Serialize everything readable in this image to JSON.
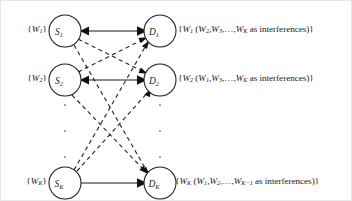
{
  "figure": {
    "background_color": "#ffffff",
    "line_color": "#1a1a1a",
    "width": 352,
    "height": 201
  },
  "nodes": {
    "sources": [
      {
        "id": "S1",
        "label": "S",
        "subscript": "1",
        "cx": 64,
        "cy": 30,
        "r": 16
      },
      {
        "id": "S2",
        "label": "S",
        "subscript": "2",
        "cx": 64,
        "cy": 79,
        "r": 16
      },
      {
        "id": "SK",
        "label": "S",
        "subscript": "K",
        "cx": 64,
        "cy": 182,
        "r": 16
      }
    ],
    "destinations": [
      {
        "id": "D1",
        "label": "D",
        "subscript": "1",
        "cx": 159,
        "cy": 30,
        "r": 16
      },
      {
        "id": "D2",
        "label": "D",
        "subscript": "2",
        "cx": 159,
        "cy": 79,
        "r": 16
      },
      {
        "id": "DK",
        "label": "D",
        "subscript": "K",
        "cx": 159,
        "cy": 182,
        "r": 16
      }
    ]
  },
  "left_labels": [
    {
      "id": "w1",
      "text": "{W1}",
      "main": "W",
      "sub": "1"
    },
    {
      "id": "w2",
      "text": "{W2}",
      "main": "W",
      "sub": "2"
    },
    {
      "id": "wK",
      "text": "{WK}",
      "main": "W",
      "sub": "K"
    }
  ],
  "right_labels": [
    {
      "id": "d1-message",
      "text": "{W1 (W2, W3,…, WK as interferences)}",
      "desired": "W",
      "desired_sub": "1",
      "interferers": [
        "W2",
        "W3"
      ],
      "last_interferer_sub": "K",
      "suffix": "as interferences"
    },
    {
      "id": "d2-message",
      "text": "{W2 (W1, W3,…, WK as interferences)}",
      "desired": "W",
      "desired_sub": "2",
      "interferers": [
        "W1",
        "W3"
      ],
      "last_interferer_sub": "K",
      "suffix": "as interferences"
    },
    {
      "id": "dK-message",
      "text": "{WK (W1, W2,…, WK−1 as interferences)}",
      "desired": "W",
      "desired_sub": "K",
      "interferers": [
        "W1",
        "W2"
      ],
      "last_interferer_sub": "K−1",
      "suffix": "as interferences"
    }
  ],
  "edges": {
    "direct_style": "solid",
    "interference_style": "dashed",
    "direct_pairs": [
      [
        "S1",
        "D1"
      ],
      [
        "S2",
        "D2"
      ],
      [
        "SK",
        "DK"
      ]
    ],
    "interference_pairs": [
      [
        "S1",
        "D2"
      ],
      [
        "S1",
        "DK"
      ],
      [
        "S2",
        "D1"
      ],
      [
        "S2",
        "DK"
      ],
      [
        "SK",
        "D1"
      ],
      [
        "SK",
        "D2"
      ]
    ]
  },
  "ellipsis": {
    "glyph": "·",
    "left_x": 64,
    "right_x": 159,
    "rows_y": [
      104,
      130,
      156
    ]
  }
}
